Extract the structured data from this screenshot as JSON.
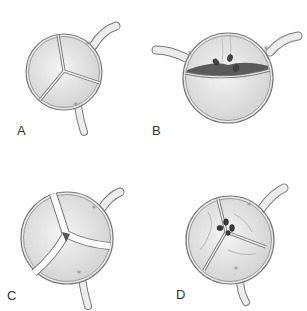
{
  "figure": {
    "panels": [
      {
        "id": "A",
        "label": "A",
        "description": "Normal trileaflet aortic valve, closed"
      },
      {
        "id": "B",
        "label": "B",
        "description": "Bicuspid valve with fused leaflets and tethered nodules"
      },
      {
        "id": "C",
        "label": "C",
        "description": "Trileaflet valve with central coaptation gap"
      },
      {
        "id": "D",
        "label": "D",
        "description": "Trileaflet valve with central vegetation / nodules"
      }
    ],
    "colors": {
      "leaflet_fill": "#dcdcdc",
      "leaflet_highlight": "#f2f2f2",
      "outline": "#777777",
      "vessel": "#e6e6e6",
      "dark_nodule": "#4a4a4a",
      "gap": "#555555"
    }
  }
}
